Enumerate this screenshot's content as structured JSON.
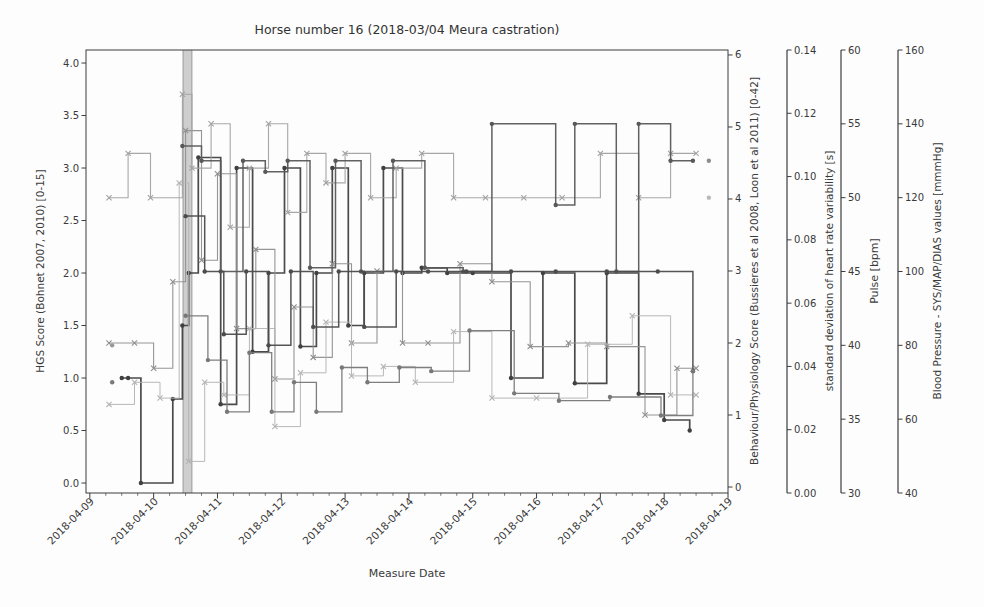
{
  "chart_data": {
    "type": "line",
    "subtype": "step-post-multi-axis",
    "title": "Horse number 16 (2018-03/04 Meura castration)",
    "xlabel": "Measure Date",
    "grid": false,
    "legend": "none",
    "x_axis": {
      "tick_labels": [
        "2018-04-09",
        "2018-04-10",
        "2018-04-11",
        "2018-04-12",
        "2018-04-13",
        "2018-04-14",
        "2018-04-15",
        "2018-04-16",
        "2018-04-17",
        "2018-04-18",
        "2018-04-19"
      ],
      "tick_days": [
        9,
        10,
        11,
        12,
        13,
        14,
        15,
        16,
        17,
        18,
        19
      ],
      "range_days": [
        8.94,
        19.0
      ],
      "minor_tick_step_days": 0.25,
      "label_rotation_deg": 45
    },
    "axes": [
      {
        "id": "hgs",
        "label": "HGS Score (Bohnet 2007, 2010) [0-15]",
        "side": "left",
        "tick_values": [
          0,
          0.5,
          1,
          1.5,
          2,
          2.5,
          3,
          3.5,
          4
        ],
        "tick_labels": [
          "0.0",
          "0.5",
          "1.0",
          "1.5",
          "2.0",
          "2.5",
          "3.0",
          "3.5",
          "4.0"
        ],
        "range": [
          -0.095,
          4.124
        ]
      },
      {
        "id": "behaviour",
        "label": "Behaviour/Physiology Score (Bussieres et al 2008, Loon et al 2011) [0-42]",
        "side": "right",
        "tick_values": [
          0,
          1,
          2,
          3,
          4,
          5,
          6
        ],
        "tick_labels": [
          "0",
          "1",
          "2",
          "3",
          "4",
          "5",
          "6"
        ],
        "range": [
          -0.083,
          6.069
        ]
      },
      {
        "id": "sdhrv",
        "label": "standard deviation of heart rate variability [s]",
        "side": "right-detached",
        "tick_values": [
          0,
          0.02,
          0.04,
          0.06,
          0.08,
          0.1,
          0.12,
          0.14
        ],
        "tick_labels": [
          "0.00",
          "0.02",
          "0.04",
          "0.06",
          "0.08",
          "0.10",
          "0.12",
          "0.14"
        ],
        "range": [
          0,
          0.14
        ]
      },
      {
        "id": "pulse",
        "label": "Pulse [bpm]",
        "side": "right-detached",
        "tick_values": [
          30,
          35,
          40,
          45,
          50,
          55,
          60
        ],
        "tick_labels": [
          "30",
          "35",
          "40",
          "45",
          "50",
          "55",
          "60"
        ],
        "range": [
          30,
          60
        ]
      },
      {
        "id": "bp",
        "label": "Blood Pressure - SYS/MAP/DIAS values [mmmHg]",
        "side": "right-detached",
        "tick_values": [
          40,
          60,
          80,
          100,
          120,
          140,
          160
        ],
        "tick_labels": [
          "40",
          "60",
          "80",
          "100",
          "120",
          "140",
          "160"
        ],
        "range": [
          40,
          160
        ]
      }
    ],
    "vspan": {
      "start_day": 10.46,
      "end_day": 10.6,
      "color": "#a8a8a8",
      "opacity": 0.55,
      "meaning": "castration time marker band"
    },
    "series": [
      {
        "name": "HGS Score",
        "axis": "hgs",
        "color": "#404040",
        "marker": "dot",
        "line_width": 1.7,
        "x": [
          9.5,
          9.6,
          9.8,
          10.3,
          10.45,
          10.55,
          10.7,
          11.05,
          11.3,
          11.55,
          11.8,
          12.05,
          12.3,
          12.55,
          12.8,
          13.05,
          13.3,
          13.6,
          13.9,
          14.2,
          14.6,
          15.0,
          15.6,
          16.1,
          16.6,
          17.1,
          17.6,
          18.0,
          18.4
        ],
        "values": [
          1.0,
          1.0,
          0.0,
          0.8,
          1.5,
          2.0,
          3.1,
          0.75,
          3.0,
          1.25,
          2.0,
          3.0,
          1.3,
          2.0,
          3.0,
          1.5,
          2.0,
          3.0,
          2.0,
          2.05,
          2.0,
          2.0,
          1.0,
          2.0,
          0.95,
          2.0,
          0.85,
          0.6,
          0.5
        ]
      },
      {
        "name": "Behaviour/Physiology Score",
        "axis": "behaviour",
        "color": "#8f8f8f",
        "marker": "x",
        "line_width": 1.1,
        "x": [
          9.3,
          9.7,
          10.0,
          10.3,
          10.5,
          10.75,
          11.0,
          11.3,
          11.6,
          11.9,
          12.2,
          12.5,
          12.8,
          13.1,
          13.5,
          13.9,
          14.3,
          14.8,
          15.3,
          15.9,
          16.5,
          17.1,
          17.7,
          18.2,
          18.5
        ],
        "values": [
          2.0,
          2.0,
          1.65,
          2.85,
          4.95,
          3.15,
          4.35,
          2.2,
          3.3,
          1.5,
          2.5,
          1.8,
          3.1,
          2.0,
          3.0,
          2.0,
          2.0,
          3.1,
          2.85,
          1.95,
          2.0,
          1.95,
          1.0,
          1.65,
          1.65
        ]
      },
      {
        "name": "sd heart rate variability",
        "axis": "sdhrv",
        "color": "#b4b4b4",
        "marker": "x",
        "line_width": 1.0,
        "x": [
          9.3,
          9.7,
          10.1,
          10.4,
          10.55,
          10.8,
          11.1,
          11.5,
          11.9,
          12.3,
          12.7,
          13.1,
          13.6,
          14.1,
          14.7,
          15.3,
          16.0,
          16.8,
          17.5,
          18.1,
          18.5
        ],
        "values": [
          0.028,
          0.035,
          0.03,
          0.098,
          0.01,
          0.035,
          0.031,
          0.052,
          0.021,
          0.038,
          0.054,
          0.037,
          0.04,
          0.035,
          0.051,
          0.03,
          0.03,
          0.047,
          0.056,
          0.031,
          0.031
        ]
      },
      {
        "name": "Pulse",
        "axis": "pulse",
        "color": "#a2a2a2",
        "marker": "x",
        "line_width": 1.1,
        "x": [
          9.3,
          9.6,
          9.95,
          10.45,
          10.6,
          10.9,
          11.2,
          11.5,
          11.8,
          12.1,
          12.4,
          12.7,
          13.0,
          13.4,
          13.8,
          14.2,
          14.7,
          15.2,
          15.8,
          16.4,
          17.0,
          17.6,
          18.1,
          18.5
        ],
        "values": [
          50,
          53,
          50,
          57,
          52,
          55,
          48,
          52,
          55,
          49,
          53,
          51,
          53,
          50,
          52,
          53,
          50,
          50,
          50,
          50,
          53,
          50,
          53,
          53
        ]
      },
      {
        "name": "Blood Pressure SYS",
        "axis": "bp",
        "color": "#585858",
        "marker": "dot",
        "line_width": 1.5,
        "x": [
          10.45,
          10.75,
          11.05,
          11.4,
          11.75,
          12.1,
          12.45,
          12.85,
          13.25,
          13.75,
          14.25,
          14.85,
          15.3,
          16.3,
          16.6,
          17.25,
          17.6,
          18.1,
          18.45
        ],
        "values": [
          134,
          130,
          100,
          130,
          127,
          130,
          101,
          130,
          100,
          130,
          101,
          100,
          140,
          118,
          140,
          100,
          140,
          130,
          130
        ]
      },
      {
        "name": "Blood Pressure MAP",
        "axis": "bp",
        "color": "#4c4c4c",
        "marker": "dot",
        "line_width": 1.5,
        "x": [
          10.5,
          10.8,
          11.1,
          11.45,
          11.8,
          12.15,
          12.5,
          12.9,
          13.3,
          13.8,
          14.3,
          14.9,
          15.6,
          16.3,
          17.1,
          17.9,
          18.45
        ],
        "values": [
          115,
          100,
          83,
          100,
          80,
          100,
          85,
          100,
          85,
          100,
          100,
          100,
          100,
          100,
          100,
          100,
          73
        ]
      },
      {
        "name": "Blood Pressure DIAS",
        "axis": "bp",
        "color": "#787878",
        "marker": "dot",
        "line_width": 1.3,
        "x": [
          10.5,
          10.85,
          11.15,
          11.5,
          11.85,
          12.2,
          12.55,
          12.95,
          13.35,
          13.85,
          14.35,
          14.95,
          15.65,
          16.35,
          17.15,
          17.95,
          18.45
        ],
        "values": [
          88,
          76,
          62,
          78,
          62,
          70,
          62,
          74,
          70,
          74,
          73,
          84,
          67,
          65,
          66,
          61,
          73
        ]
      }
    ],
    "isolated_points": [
      {
        "day": 9.35,
        "axis": "bp",
        "value": 80,
        "color": "#9a9a9a",
        "marker": "dot"
      },
      {
        "day": 9.35,
        "axis": "bp",
        "value": 70,
        "color": "#7a7a7a",
        "marker": "dot"
      },
      {
        "day": 18.7,
        "axis": "bp",
        "value": 130,
        "color": "#8c8c8c",
        "marker": "dot"
      },
      {
        "day": 18.7,
        "axis": "pulse",
        "value": 50,
        "color": "#b8b8b8",
        "marker": "dot"
      }
    ],
    "spine_color": "#3c3c3c"
  }
}
